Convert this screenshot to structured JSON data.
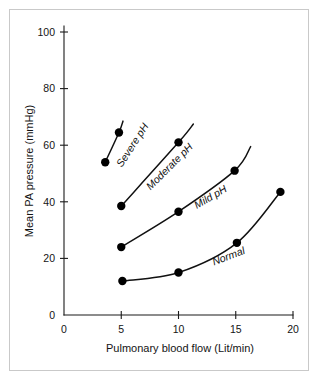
{
  "chart_data": {
    "type": "line",
    "title": "",
    "xlabel": "Pulmonary blood flow (Lit/min)",
    "ylabel": "Mean PA pressure (mmHg)",
    "xlim": [
      0,
      20
    ],
    "ylim": [
      0,
      100
    ],
    "xticks": [
      "0",
      "5",
      "10",
      "15",
      "20"
    ],
    "xtick_values": [
      0,
      5,
      10,
      15,
      20
    ],
    "yticks": [
      "0",
      "20",
      "40",
      "60",
      "80",
      "100"
    ],
    "ytick_values": [
      0,
      20,
      40,
      60,
      80,
      100
    ],
    "grid": false,
    "legend": "inline-curve-labels",
    "marker": "filled-circle",
    "marker_color": "#000000",
    "line_color": "#111111",
    "background": "#ffffff",
    "frame_color": "#c9c9c9",
    "series": [
      {
        "name": "Severe pH",
        "label": "Severe pH",
        "label_angle": -57,
        "x": [
          3.6,
          4.8
        ],
        "y": [
          54.0,
          64.5
        ],
        "extend_to": {
          "x": 5.15,
          "y": 68.5
        }
      },
      {
        "name": "Moderate pH",
        "label": "Moderate pH",
        "label_angle": -45,
        "x": [
          5.0,
          10.0
        ],
        "y": [
          38.5,
          61.0
        ],
        "extend_to": {
          "x": 11.3,
          "y": 67.5
        }
      },
      {
        "name": "Mild pH",
        "label": "Mild pH",
        "label_angle": -30,
        "x": [
          5.0,
          10.0,
          14.9
        ],
        "y": [
          24.0,
          36.5,
          51.0
        ],
        "extend_to": {
          "x": 16.3,
          "y": 59.5
        }
      },
      {
        "name": "Normal",
        "label": "Normal",
        "label_angle": -21,
        "x": [
          5.1,
          10.0,
          15.1,
          18.9
        ],
        "y": [
          12.0,
          15.0,
          25.5,
          43.5
        ],
        "extend_to": null
      }
    ]
  }
}
